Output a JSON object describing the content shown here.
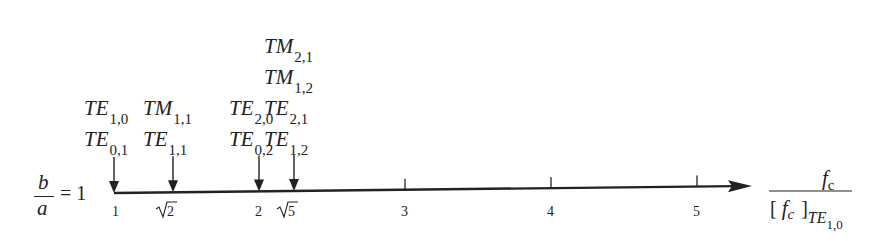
{
  "diagram": {
    "ratio_label": {
      "numerator": "b",
      "denominator": "a",
      "equals": "= 1"
    },
    "axis": {
      "label_numerator": {
        "main": "f",
        "sub": "c"
      },
      "label_denominator": {
        "open": "[",
        "main": "f",
        "sub": "c",
        "close": "]",
        "sub2_main": "TE",
        "sub2_idx": "1,0"
      },
      "ticks": [
        {
          "label": "1",
          "x": 116,
          "sqrt": false
        },
        {
          "label": "2",
          "x": 173,
          "sqrt": true
        },
        {
          "label": "2",
          "x": 259,
          "sqrt": false
        },
        {
          "label": "5",
          "x": 294,
          "sqrt": true
        },
        {
          "label": "3",
          "x": 405,
          "sqrt": false,
          "tick": true
        },
        {
          "label": "4",
          "x": 551,
          "sqrt": false,
          "tick": true
        },
        {
          "label": "5",
          "x": 697,
          "sqrt": false,
          "tick": true
        }
      ]
    },
    "modes": [
      {
        "x": 114,
        "labels": [
          {
            "m": "TE",
            "i": "1,0"
          },
          {
            "m": "TE",
            "i": "0,1"
          }
        ]
      },
      {
        "x": 173,
        "labels": [
          {
            "m": "TM",
            "i": "1,1"
          },
          {
            "m": "TE",
            "i": "1,1"
          }
        ]
      },
      {
        "x": 259,
        "labels": [
          {
            "m": "TE",
            "i": "2,0"
          },
          {
            "m": "TE",
            "i": "0,2"
          }
        ]
      },
      {
        "x": 294,
        "labels": [
          {
            "m": "TM",
            "i": "2,1"
          },
          {
            "m": "TM",
            "i": "1,2"
          },
          {
            "m": "TE",
            "i": "2,1"
          },
          {
            "m": "TE",
            "i": "1,2"
          }
        ]
      }
    ]
  }
}
